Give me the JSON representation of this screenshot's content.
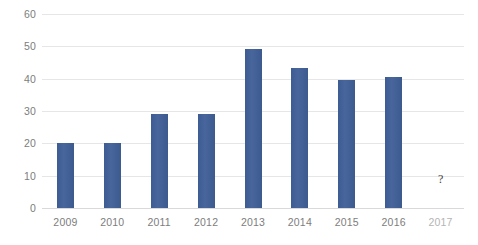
{
  "chart_data": {
    "type": "bar",
    "title": "",
    "subtitle": "",
    "xlabel": "",
    "ylabel": "",
    "categories": [
      "2009",
      "2010",
      "2011",
      "2012",
      "2013",
      "2014",
      "2015",
      "2016",
      "2017"
    ],
    "values": [
      20.0,
      20.1,
      29.0,
      29.2,
      49.3,
      43.3,
      39.5,
      40.5,
      null
    ],
    "ylim": [
      0,
      60
    ],
    "y_ticks": [
      0,
      10,
      20,
      30,
      40,
      50,
      60
    ],
    "y_tick_labels": [
      "0",
      "10",
      "20",
      "30",
      "40",
      "50",
      "60"
    ],
    "grid": true,
    "legend": false,
    "legend_position": "none",
    "series": [
      {
        "name": "",
        "color": "#41618f",
        "values": [
          20.0,
          20.1,
          29.0,
          29.2,
          49.3,
          43.3,
          39.5,
          40.5,
          null
        ]
      }
    ],
    "annotations": [
      {
        "text": "?",
        "category": "2017",
        "value": 7,
        "note": "question mark shown in place of missing 2017 bar"
      }
    ],
    "colors": {
      "bar": "#41618f",
      "gridline": "#e6e6e6",
      "axis_text": "#7d7d7d",
      "muted_axis_text": "#b4b4b4",
      "background": "#ffffff"
    }
  }
}
